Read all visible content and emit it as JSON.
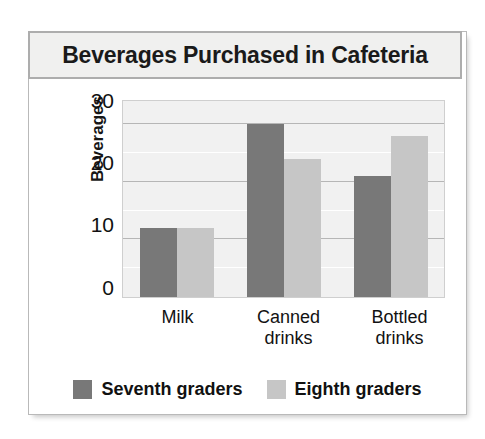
{
  "chart_data": {
    "type": "bar",
    "title": "Beverages Purchased in Cafeteria",
    "xlabel": "",
    "ylabel": "Beverages",
    "categories": [
      "Milk",
      "Canned drinks",
      "Bottled drinks"
    ],
    "category_lines": [
      [
        "Milk"
      ],
      [
        "Canned",
        "drinks"
      ],
      [
        "Bottled",
        "drinks"
      ]
    ],
    "series": [
      {
        "name": "Seventh graders",
        "color": "#787878",
        "values": [
          12,
          30,
          21
        ]
      },
      {
        "name": "Eighth graders",
        "color": "#c6c6c6",
        "values": [
          12,
          24,
          28
        ]
      }
    ],
    "ylim": [
      0,
      34
    ],
    "yticks": [
      0,
      10,
      20,
      30
    ],
    "ytick_labels": [
      "0",
      "10",
      "20",
      "30"
    ],
    "minor_gridlines": [
      5,
      10,
      15,
      20,
      25,
      30
    ],
    "grid": true,
    "legend_position": "bottom",
    "plot_background": "#f1f1f1"
  },
  "legend": {
    "items": [
      {
        "label": "Seventh graders"
      },
      {
        "label": "Eighth graders"
      }
    ]
  }
}
